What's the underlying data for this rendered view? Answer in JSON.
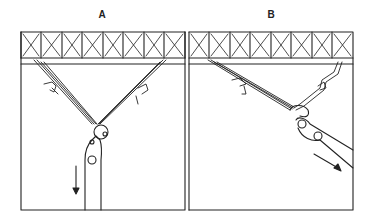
{
  "panels": [
    {
      "id": "A",
      "label": "A",
      "description": "Two slings from truss converge at a shackle; pulley and pole pulled straight down",
      "arrow_direction": "down"
    },
    {
      "id": "B",
      "label": "B",
      "description": "Slings from truss converge at a shackle; pulley and pole pulled diagonally down-right",
      "arrow_direction": "down-right"
    }
  ],
  "colors": {
    "line": "#222222",
    "background": "#ffffff"
  }
}
